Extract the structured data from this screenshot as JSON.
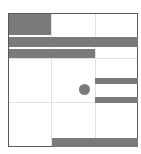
{
  "board": {
    "label": "sliding block puzzle board",
    "border_color": "#5a5a5a",
    "grid_color": "#e2e2e2",
    "piece_color": "#7a7a7a",
    "columns": 3,
    "rows": 3
  },
  "pieces": [
    {
      "id": "block-top-left",
      "x": 0,
      "y": 0,
      "w": 42,
      "h": 21
    },
    {
      "id": "bar-full-width",
      "x": 0,
      "y": 23,
      "w": 129,
      "h": 10
    },
    {
      "id": "bar-two-thirds",
      "x": 0,
      "y": 35,
      "w": 86,
      "h": 9
    },
    {
      "id": "bar-right-upper",
      "x": 86,
      "y": 64,
      "w": 43,
      "h": 6
    },
    {
      "id": "bar-right-lower",
      "x": 86,
      "y": 83,
      "w": 43,
      "h": 6
    },
    {
      "id": "bar-bottom",
      "x": 43,
      "y": 125,
      "w": 86,
      "h": 9
    }
  ],
  "marker": {
    "id": "circle-marker",
    "cx": 76,
    "cy": 76,
    "r": 5
  }
}
